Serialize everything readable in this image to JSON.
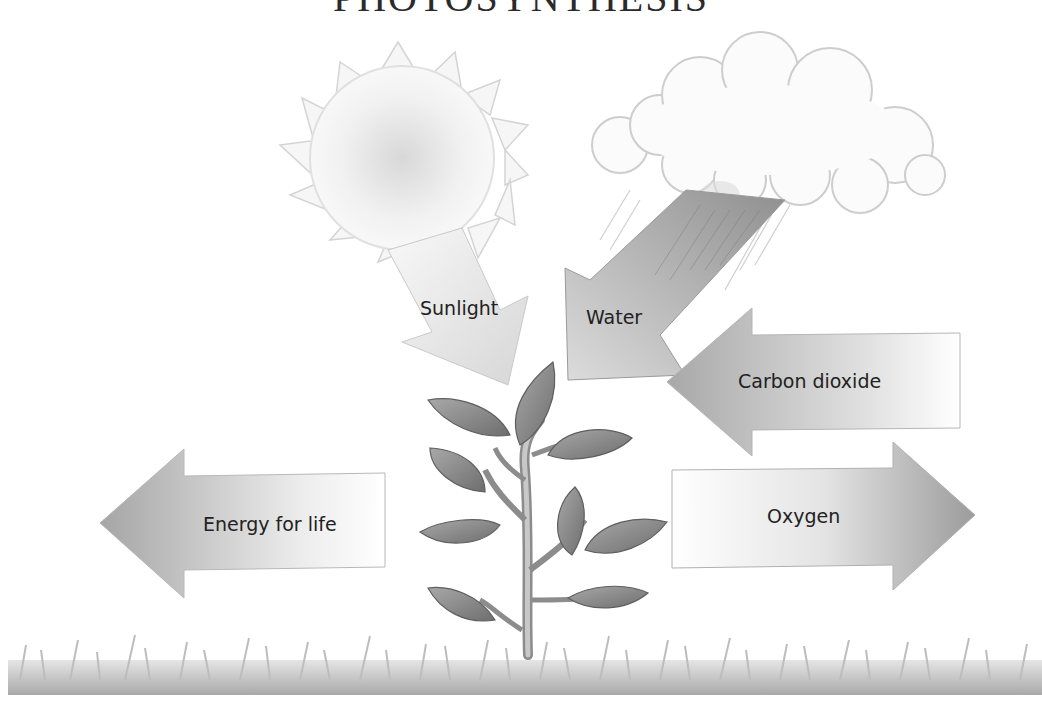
{
  "diagram": {
    "title": "PHOTOSYNTHESIS",
    "labels": {
      "sunlight": "Sunlight",
      "water": "Water",
      "carbon_dioxide": "Carbon dioxide",
      "energy": "Energy for life",
      "oxygen": "Oxygen"
    },
    "elements": [
      "sun-icon",
      "rain-cloud-icon",
      "plant-icon",
      "grass"
    ],
    "colors": {
      "arrow_dark": "#9a9a9a",
      "arrow_light": "#f4f4f4",
      "sun": "#efefef",
      "leaf": "#8a8a8a",
      "grass": "#b5b5b5",
      "text": "#222222"
    }
  }
}
